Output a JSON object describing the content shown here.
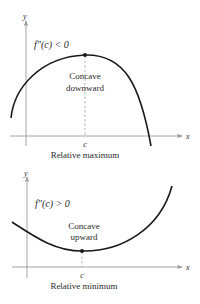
{
  "top_panel": {
    "axis_y_label": "y",
    "axis_x_label": "x",
    "condition": "f″(c) < 0",
    "concavity_line1": "Concave",
    "concavity_line2": "downward",
    "point_label": "c",
    "caption": "Relative maximum",
    "curve": {
      "start": [
        11,
        118
      ],
      "peak": [
        85,
        55
      ],
      "end": [
        151,
        146
      ]
    }
  },
  "bottom_panel": {
    "axis_y_label": "y",
    "axis_x_label": "x",
    "condition": "f″(c) > 0",
    "concavity_line1": "Concave",
    "concavity_line2": "upward",
    "point_label": "c",
    "caption": "Relative minimum",
    "curve": {
      "start": [
        12,
        222
      ],
      "trough": [
        82,
        251
      ],
      "end": [
        172,
        186
      ]
    }
  },
  "colors": {
    "curve": "#1a1a1a",
    "axes": "#9a9a9a",
    "text": "#2a2a2a"
  }
}
